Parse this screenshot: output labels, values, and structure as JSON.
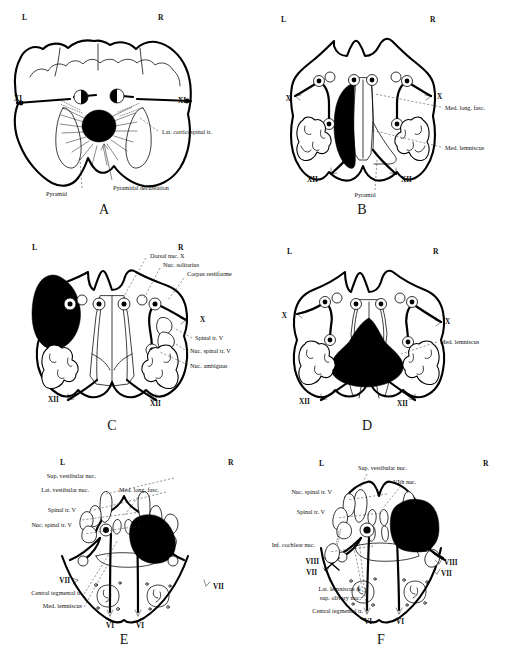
{
  "figure": {
    "orientation_left": "L",
    "orientation_right": "R",
    "colors": {
      "ink": "#000000",
      "paper": "#ffffff",
      "leader": "#333333"
    }
  },
  "panels": [
    {
      "id": "A",
      "caption": "A",
      "left_marker": "L",
      "right_marker": "R",
      "level": "closed medulla / pyramidal decussation",
      "labels": [
        {
          "text": "XI",
          "side": "left",
          "x": 9,
          "y": 99
        },
        {
          "text": "XI",
          "side": "right",
          "x": 176,
          "y": 99
        },
        {
          "text": "Lat. corticospinal tr.",
          "side": "right",
          "x": 160,
          "y": 131
        },
        {
          "text": "Pyramidal decussation",
          "side": "right",
          "x": 113,
          "y": 184
        },
        {
          "text": "Pyramid",
          "side": "left",
          "x": 46,
          "y": 192
        }
      ]
    },
    {
      "id": "B",
      "caption": "B",
      "left_marker": "L",
      "right_marker": "R",
      "level": "sensory decussation / lower medulla",
      "labels": [
        {
          "text": "X",
          "side": "left",
          "x": 15,
          "y": 99
        },
        {
          "text": "X",
          "side": "right",
          "x": 189,
          "y": 97
        },
        {
          "text": "Med. long. fasc.",
          "side": "right",
          "x": 190,
          "y": 110
        },
        {
          "text": "Med. lemniscus",
          "side": "right",
          "x": 190,
          "y": 149
        },
        {
          "text": "XII",
          "side": "left",
          "x": 52,
          "y": 177
        },
        {
          "text": "XII",
          "side": "right",
          "x": 146,
          "y": 177
        },
        {
          "text": "Pyramid",
          "side": "center",
          "x": 108,
          "y": 193
        }
      ]
    },
    {
      "id": "C",
      "caption": "C",
      "left_marker": "L",
      "right_marker": "R",
      "level": "mid medulla / open medulla",
      "labels": [
        {
          "text": "Dorsal nuc. X",
          "side": "right",
          "x": 150,
          "y": 33
        },
        {
          "text": "Nuc. solitarius",
          "side": "right",
          "x": 163,
          "y": 42
        },
        {
          "text": "Corpus restiforme",
          "side": "right",
          "x": 187,
          "y": 51
        },
        {
          "text": "X",
          "side": "right",
          "x": 200,
          "y": 97
        },
        {
          "text": "Spinal tr. V",
          "side": "right",
          "x": 195,
          "y": 115
        },
        {
          "text": "Nuc. spinal tr. V",
          "side": "right",
          "x": 190,
          "y": 128
        },
        {
          "text": "Nuc. ambiguus",
          "side": "right",
          "x": 190,
          "y": 143
        },
        {
          "text": "XII",
          "side": "left",
          "x": 51,
          "y": 172
        },
        {
          "text": "XII",
          "side": "right",
          "x": 152,
          "y": 174
        }
      ]
    },
    {
      "id": "D",
      "caption": "D",
      "left_marker": "L",
      "right_marker": "R",
      "level": "upper medulla",
      "labels": [
        {
          "text": "X",
          "side": "left",
          "x": 16,
          "y": 89
        },
        {
          "text": "X",
          "side": "right",
          "x": 192,
          "y": 98
        },
        {
          "text": "Med. lemniscus",
          "side": "right",
          "x": 185,
          "y": 118
        },
        {
          "text": "XII",
          "side": "left",
          "x": 46,
          "y": 170
        },
        {
          "text": "XII",
          "side": "right",
          "x": 144,
          "y": 171
        }
      ]
    },
    {
      "id": "E",
      "caption": "E",
      "left_marker": "L",
      "right_marker": "R",
      "level": "lower pons",
      "labels": [
        {
          "text": "Sup. vestibular nuc.",
          "side": "left",
          "x": 96,
          "y": 32
        },
        {
          "text": "Lat. vestibular nuc.",
          "side": "left",
          "x": 89,
          "y": 46
        },
        {
          "text": "Med. long. fasc.",
          "side": "center",
          "x": 119,
          "y": 46
        },
        {
          "text": "Spinal tr. V",
          "side": "left",
          "x": 76,
          "y": 66
        },
        {
          "text": "Nuc. spinal tr. V",
          "side": "left",
          "x": 72,
          "y": 81
        },
        {
          "text": "VII",
          "side": "left",
          "x": 60,
          "y": 135
        },
        {
          "text": "VII",
          "side": "right",
          "x": 211,
          "y": 140
        },
        {
          "text": "Central tegmental tr.",
          "side": "left",
          "x": 75,
          "y": 148
        },
        {
          "text": "Med. lemniscus",
          "side": "left",
          "x": 78,
          "y": 161
        },
        {
          "text": "VI",
          "side": "left",
          "x": 127,
          "y": 181
        },
        {
          "text": "VI",
          "side": "right",
          "x": 158,
          "y": 181
        }
      ]
    },
    {
      "id": "F",
      "caption": "F",
      "left_marker": "L",
      "right_marker": "R",
      "level": "pons at facial colliculus",
      "labels": [
        {
          "text": "Sup. vestibular nuc.",
          "side": "center",
          "x": 160,
          "y": 25
        },
        {
          "text": "VIth nuc.",
          "side": "center",
          "x": 162,
          "y": 38
        },
        {
          "text": "Nuc. spinal tr. V",
          "side": "left",
          "x": 77,
          "y": 48
        },
        {
          "text": "Spinal tr. V",
          "side": "left",
          "x": 70,
          "y": 67
        },
        {
          "text": "Inf. cochlear nuc.",
          "side": "left",
          "x": 60,
          "y": 100
        },
        {
          "text": "VIII",
          "side": "left",
          "x": 54,
          "y": 117
        },
        {
          "text": "VII",
          "side": "left",
          "x": 50,
          "y": 128
        },
        {
          "text": "VIII",
          "side": "right",
          "x": 196,
          "y": 118
        },
        {
          "text": "VII",
          "side": "right",
          "x": 192,
          "y": 128
        },
        {
          "text": "Lat. lemniscus &",
          "side": "left",
          "x": 56,
          "y": 145
        },
        {
          "text": "sup. olivary nuc.",
          "side": "left",
          "x": 60,
          "y": 154
        },
        {
          "text": "Central tegmental tr.",
          "side": "left",
          "x": 70,
          "y": 167
        },
        {
          "text": "VI",
          "side": "left",
          "x": 120,
          "y": 175
        },
        {
          "text": "VI",
          "side": "right",
          "x": 152,
          "y": 175
        }
      ]
    }
  ]
}
